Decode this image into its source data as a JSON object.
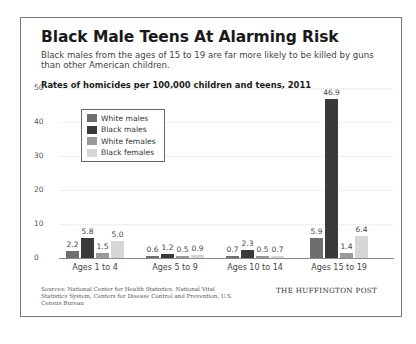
{
  "header": {
    "title": "Black Male Teens At Alarming Risk",
    "subtitle": "Black males from the ages of 15 to 19 are far more likely to be killed by guns than other American children.",
    "chart_title": "Rates of homicides per 100,000 children and teens, 2011"
  },
  "footer": {
    "sources": "Sources: National Center for Health Statistics, National Vital Statistics System, Centers for Disease Control and Prevention, U.S. Census Bureau",
    "brand": "THE HUFFINGTON POST"
  },
  "legend": {
    "items": [
      {
        "label": "White males",
        "color": "#6e6e6e"
      },
      {
        "label": "Black males",
        "color": "#3a3a3a"
      },
      {
        "label": "White females",
        "color": "#9a9a9a"
      },
      {
        "label": "Black females",
        "color": "#d6d6d6"
      }
    ]
  },
  "axis": {
    "y_ticks": [
      "50",
      "40",
      "30",
      "20",
      "10",
      "0"
    ]
  },
  "groups": [
    {
      "label": "Ages 1 to 4",
      "values": [
        "2.2",
        "5.8",
        "1.5",
        "5.0"
      ]
    },
    {
      "label": "Ages 5 to 9",
      "values": [
        "0.6",
        "1.2",
        "0.5",
        "0.9"
      ]
    },
    {
      "label": "Ages 10 to 14",
      "values": [
        "0.7",
        "2.3",
        "0.5",
        "0.7"
      ]
    },
    {
      "label": "Ages 15 to 19",
      "values": [
        "5.9",
        "46.9",
        "1.4",
        "6.4"
      ]
    }
  ],
  "chart_data": {
    "type": "bar",
    "title": "Black Male Teens At Alarming Risk",
    "subtitle": "Rates of homicides per 100,000 children and teens, 2011",
    "categories": [
      "Ages 1 to 4",
      "Ages 5 to 9",
      "Ages 10 to 14",
      "Ages 15 to 19"
    ],
    "series": [
      {
        "name": "White males",
        "values": [
          2.2,
          0.6,
          0.7,
          5.9
        ],
        "color": "#6e6e6e"
      },
      {
        "name": "Black males",
        "values": [
          5.8,
          1.2,
          2.3,
          46.9
        ],
        "color": "#3a3a3a"
      },
      {
        "name": "White females",
        "values": [
          1.5,
          0.5,
          0.5,
          1.4
        ],
        "color": "#9a9a9a"
      },
      {
        "name": "Black females",
        "values": [
          5.0,
          0.9,
          0.7,
          6.4
        ],
        "color": "#d6d6d6"
      }
    ],
    "xlabel": "",
    "ylabel": "",
    "ylim": [
      0,
      50
    ],
    "yticks": [
      0,
      10,
      20,
      30,
      40,
      50
    ],
    "grid": true,
    "legend_position": "upper left (inside plot)",
    "data_labels": true
  }
}
